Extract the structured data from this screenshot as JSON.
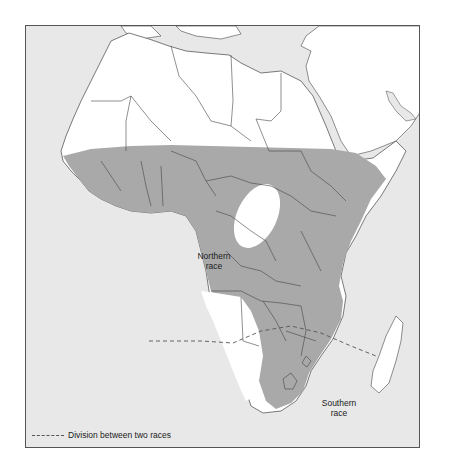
{
  "map": {
    "title": "",
    "region": "Africa",
    "colors": {
      "sea": "#e8e8e8",
      "land": "#ffffff",
      "range": "#a9a9a9",
      "border": "#444444",
      "division_line": "#555555"
    }
  },
  "labels": {
    "northern_race": "Northern\nrace",
    "northern_race_line1": "Northern",
    "northern_race_line2": "race",
    "southern_race_line1": "Southern",
    "southern_race_line2": "race"
  },
  "legend": {
    "items": [
      {
        "symbol": "dashed-line",
        "label": "Division between two races"
      }
    ]
  }
}
